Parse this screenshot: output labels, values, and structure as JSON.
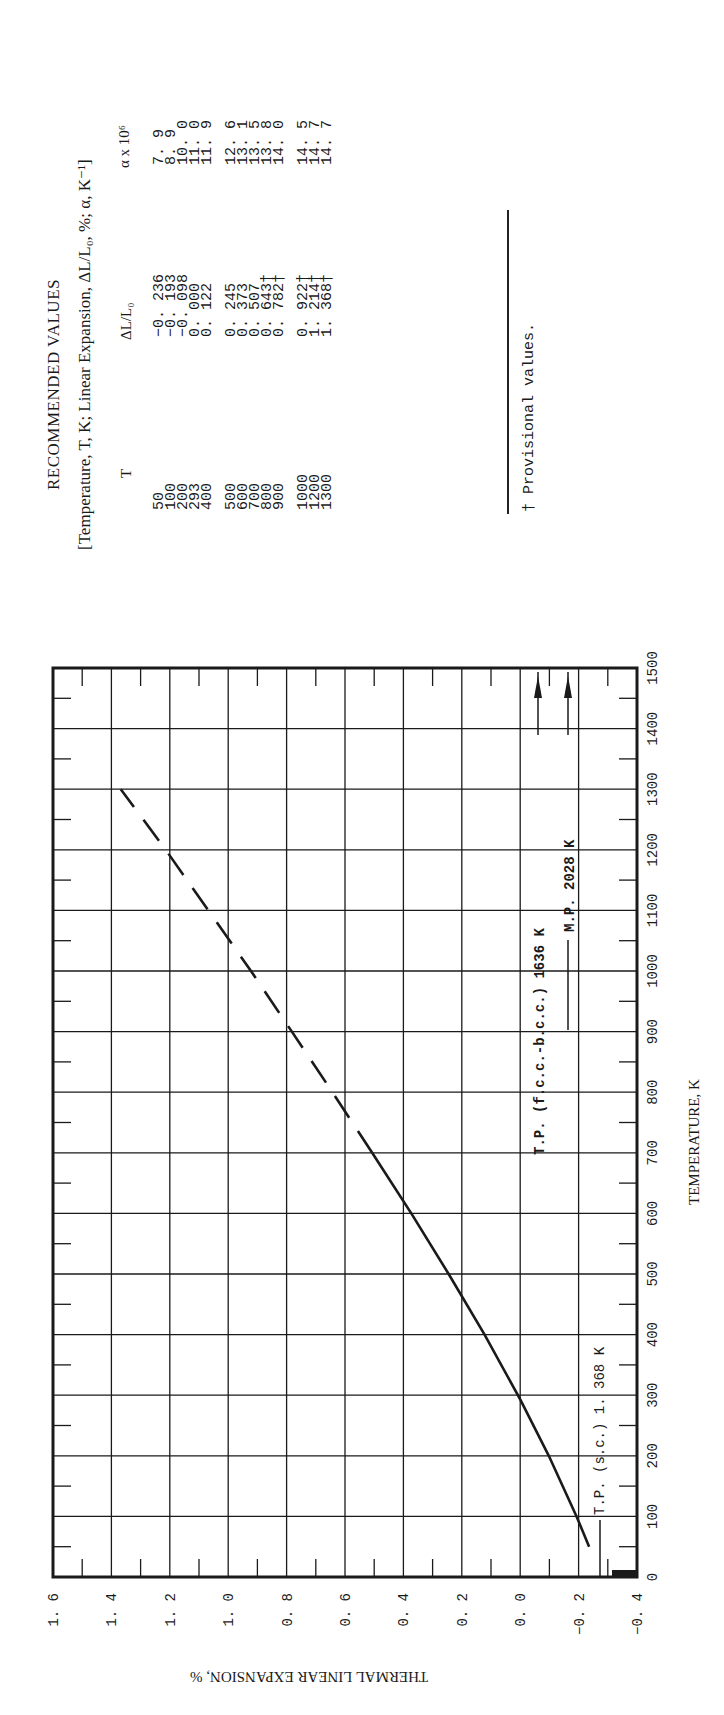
{
  "table": {
    "title": "RECOMMENDED VALUES",
    "subtitle": "[Temperature, T, K; Linear Expansion, ΔL/L₀, %; α, K⁻¹]",
    "columns": [
      "T",
      "ΔL/L₀",
      "α x 10⁶"
    ],
    "groups": [
      [
        {
          "T": "50",
          "dL": "-0.236",
          "alpha": "7.9"
        },
        {
          "T": "100",
          "dL": "-0.193",
          "alpha": "8.9"
        },
        {
          "T": "200",
          "dL": "-0.098",
          "alpha": "10.0"
        },
        {
          "T": "293",
          "dL": "0.000",
          "alpha": "11.0"
        },
        {
          "T": "400",
          "dL": "0.122",
          "alpha": "11.9"
        }
      ],
      [
        {
          "T": "500",
          "dL": "0.245",
          "alpha": "12.6"
        },
        {
          "T": "600",
          "dL": "0.373",
          "alpha": "13.1"
        },
        {
          "T": "700",
          "dL": "0.507",
          "alpha": "13.5"
        },
        {
          "T": "800",
          "dL": "0.643†",
          "alpha": "13.8"
        },
        {
          "T": "900",
          "dL": "0.782†",
          "alpha": "14.0"
        }
      ],
      [
        {
          "T": "1000",
          "dL": "0.922†",
          "alpha": "14.5"
        },
        {
          "T": "1200",
          "dL": "1.214†",
          "alpha": "14.7"
        },
        {
          "T": "1300",
          "dL": "1.368†",
          "alpha": "14.7"
        }
      ]
    ],
    "footnote": "† Provisional values."
  },
  "chart_data": {
    "type": "line",
    "title": "",
    "xlabel": "TEMPERATURE, K",
    "ylabel": "THERMAL LINEAR EXPANSION, %",
    "xlim": [
      0,
      1500
    ],
    "ylim": [
      -0.4,
      1.6
    ],
    "x_ticks": [
      0,
      100,
      200,
      300,
      400,
      500,
      600,
      700,
      800,
      900,
      1000,
      1100,
      1200,
      1300,
      1400,
      1500
    ],
    "y_ticks": [
      "1.6",
      "1.4",
      "1.2",
      "1.0",
      "0.8",
      "0.6",
      "0.4",
      "0.2",
      "0.0",
      "-0.2",
      "-0.4"
    ],
    "grid": true,
    "series": [
      {
        "name": "Recommended curve",
        "x": [
          50,
          100,
          200,
          293,
          400,
          500,
          600,
          700,
          800,
          900,
          1000,
          1200,
          1300
        ],
        "y": [
          -0.236,
          -0.193,
          -0.098,
          0.0,
          0.122,
          0.245,
          0.373,
          0.507,
          0.643,
          0.782,
          0.922,
          1.214,
          1.368
        ],
        "solid_until": 690,
        "dashed_from": 690
      }
    ],
    "annotations": [
      {
        "text": "T.P. (s.c.) 1.368 K",
        "at_T": 0,
        "marker": "line"
      },
      {
        "text": "T.P. (f.c.c.-b.c.c.) 1636 K",
        "at_T": 1500,
        "marker": "arrow"
      },
      {
        "text": "M.P. 2028 K",
        "at_T": 1500,
        "marker": "arrow"
      }
    ]
  },
  "colors": {
    "ink": "#1a1a1a",
    "paper": "#ffffff"
  }
}
